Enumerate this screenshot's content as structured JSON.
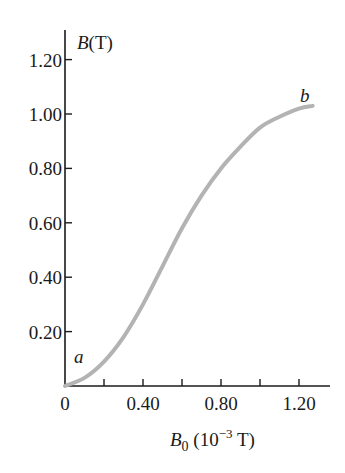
{
  "chart_data": {
    "type": "line",
    "title": "",
    "xlabel": "B0 (10^-3 T)",
    "ylabel": "B(T)",
    "xlabel_parts": {
      "symbol": "B",
      "sub": "0",
      "unit_open": " (10",
      "exp": "−3",
      "unit_close": " T)"
    },
    "ylabel_parts": {
      "symbol": "B",
      "unit": "(T)"
    },
    "xlim": [
      0,
      1.3
    ],
    "ylim": [
      0,
      1.3
    ],
    "x_tick_labels": [
      "0",
      "0.40",
      "0.80",
      "1.20"
    ],
    "x_ticks": [
      0.2,
      0.4,
      0.6,
      0.8,
      1.0,
      1.2
    ],
    "y_tick_labels": [
      "0.20",
      "0.40",
      "0.60",
      "0.80",
      "1.00",
      "1.20"
    ],
    "y_ticks": [
      0.2,
      0.4,
      0.6,
      0.8,
      1.0,
      1.2
    ],
    "grid": false,
    "series": [
      {
        "name": "magnetization curve",
        "color": "#b3b3b3",
        "x": [
          0,
          0.1,
          0.2,
          0.3,
          0.4,
          0.5,
          0.6,
          0.7,
          0.8,
          0.9,
          1.0,
          1.1,
          1.2,
          1.27
        ],
        "y": [
          0,
          0.03,
          0.09,
          0.18,
          0.3,
          0.44,
          0.58,
          0.7,
          0.8,
          0.88,
          0.95,
          0.99,
          1.02,
          1.03
        ]
      }
    ],
    "annotations": [
      {
        "text": "a",
        "x": 0.04,
        "y": 0.1
      },
      {
        "text": "b",
        "x": 1.2,
        "y": 1.08
      }
    ]
  }
}
